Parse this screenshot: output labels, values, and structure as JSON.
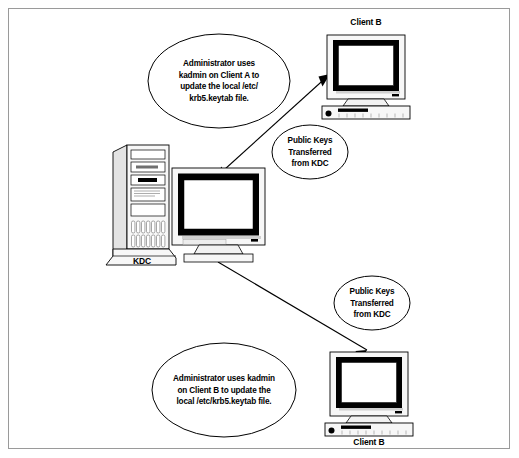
{
  "diagram": {
    "border_color": "#9a9a9a",
    "line_color": "#000000",
    "case_fill": "#f2f2f2",
    "bezel_color": "#000000",
    "screen_fill": "#ffffff"
  },
  "nodes": {
    "kdc": {
      "label": "KDC",
      "icon": "tower-computer-icon"
    },
    "client_top": {
      "label": "Client B",
      "icon": "desktop-computer-icon"
    },
    "client_bottom": {
      "label": "Client B",
      "icon": "desktop-computer-icon"
    }
  },
  "callouts": {
    "admin_client_a": {
      "lines": [
        "Administrator uses",
        "kadmin on Client A to",
        "update the local /etc/",
        "krb5.keytab file."
      ]
    },
    "admin_client_b": {
      "lines": [
        "Administrator uses kadmin",
        "on Client B to update the",
        "local /etc/krb5.keytab file."
      ]
    },
    "public_keys_top": {
      "lines": [
        "Public Keys",
        "Transferred",
        "from KDC"
      ]
    },
    "public_keys_bottom": {
      "lines": [
        "Public Keys",
        "Transferred",
        "from KDC"
      ]
    }
  },
  "connectors": [
    {
      "name": "kdc-to-client-top",
      "from": "kdc",
      "to": "client_top",
      "arrowheads": "both"
    },
    {
      "name": "kdc-to-client-bottom",
      "from": "kdc",
      "to": "client_bottom",
      "arrowheads": "both"
    }
  ]
}
